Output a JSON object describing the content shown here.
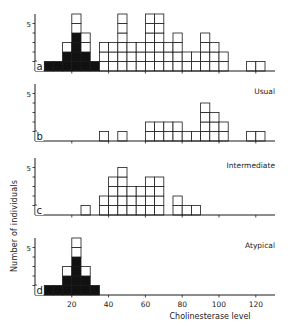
{
  "figure": {
    "ylabel": "Number of individuals",
    "xlabel": "Cholinesterase level"
  },
  "chart_data": [
    {
      "type": "bar",
      "panel": "a",
      "title": "",
      "xlabel": "Cholinesterase level",
      "ylabel": "Number of individuals",
      "bin_width": 5,
      "bin_starts": [
        5,
        10,
        15,
        20,
        25,
        30,
        35,
        40,
        45,
        50,
        55,
        60,
        65,
        70,
        75,
        80,
        85,
        90,
        95,
        100,
        105,
        110,
        115,
        120
      ],
      "series": [
        {
          "name": "Atypical (filled)",
          "color": "#000000",
          "values": [
            1,
            1,
            2,
            4,
            2,
            1,
            0,
            0,
            0,
            0,
            0,
            0,
            0,
            0,
            0,
            0,
            0,
            0,
            0,
            0,
            0,
            0,
            0,
            0
          ]
        },
        {
          "name": "Other (open)",
          "color": "#ffffff",
          "values": [
            0,
            0,
            1,
            2,
            2,
            0,
            3,
            3,
            6,
            3,
            3,
            6,
            6,
            3,
            4,
            2,
            2,
            4,
            3,
            2,
            0,
            0,
            1,
            1
          ]
        }
      ],
      "yticks": [
        5
      ],
      "xlim": [
        0,
        130
      ],
      "ylim": [
        0,
        6.5
      ]
    },
    {
      "type": "bar",
      "panel": "b",
      "title": "Usual",
      "bin_width": 5,
      "bin_starts": [
        5,
        10,
        15,
        20,
        25,
        30,
        35,
        40,
        45,
        50,
        55,
        60,
        65,
        70,
        75,
        80,
        85,
        90,
        95,
        100,
        105,
        110,
        115,
        120
      ],
      "series": [
        {
          "name": "Usual",
          "color": "#ffffff",
          "values": [
            0,
            0,
            0,
            0,
            0,
            0,
            1,
            0,
            1,
            0,
            0,
            2,
            2,
            2,
            2,
            1,
            1,
            4,
            3,
            2,
            0,
            0,
            1,
            1
          ]
        }
      ],
      "yticks": [
        5
      ],
      "xlim": [
        0,
        130
      ],
      "ylim": [
        0,
        6.5
      ]
    },
    {
      "type": "bar",
      "panel": "c",
      "title": "Intermediate",
      "bin_width": 5,
      "bin_starts": [
        5,
        10,
        15,
        20,
        25,
        30,
        35,
        40,
        45,
        50,
        55,
        60,
        65,
        70,
        75,
        80,
        85,
        90,
        95,
        100,
        105,
        110,
        115,
        120
      ],
      "series": [
        {
          "name": "Intermediate",
          "color": "#ffffff",
          "values": [
            0,
            0,
            0,
            0,
            1,
            0,
            2,
            4,
            5,
            3,
            3,
            4,
            4,
            0,
            2,
            1,
            1,
            0,
            0,
            0,
            0,
            0,
            0,
            0
          ]
        }
      ],
      "yticks": [
        5
      ],
      "xlim": [
        0,
        130
      ],
      "ylim": [
        0,
        6.5
      ]
    },
    {
      "type": "bar",
      "panel": "d",
      "title": "Atypical",
      "bin_width": 5,
      "bin_starts": [
        5,
        10,
        15,
        20,
        25,
        30,
        35,
        40,
        45,
        50,
        55,
        60,
        65,
        70,
        75,
        80,
        85,
        90,
        95,
        100,
        105,
        110,
        115,
        120
      ],
      "series": [
        {
          "name": "Atypical (filled)",
          "color": "#000000",
          "values": [
            1,
            1,
            2,
            4,
            2,
            1,
            0,
            0,
            0,
            0,
            0,
            0,
            0,
            0,
            0,
            0,
            0,
            0,
            0,
            0,
            0,
            0,
            0,
            0
          ]
        },
        {
          "name": "Atypical (open)",
          "color": "#ffffff",
          "values": [
            0,
            0,
            1,
            2,
            1,
            0,
            0,
            0,
            0,
            0,
            0,
            0,
            0,
            0,
            0,
            0,
            0,
            0,
            0,
            0,
            0,
            0,
            0,
            0
          ]
        }
      ],
      "xticks": [
        20,
        40,
        60,
        80,
        100,
        120
      ],
      "xtick_labels": [
        "20",
        "40",
        "60",
        "80",
        "100",
        "120"
      ],
      "yticks": [
        5
      ],
      "xlim": [
        0,
        130
      ],
      "ylim": [
        0,
        6.5
      ]
    }
  ],
  "panels": [
    {
      "letter": "a",
      "title": "",
      "ytick": "5"
    },
    {
      "letter": "b",
      "title": "Usual",
      "ytick": "5"
    },
    {
      "letter": "c",
      "title": "Intermediate",
      "ytick": "5"
    },
    {
      "letter": "d",
      "title": "Atypical",
      "ytick": "5"
    }
  ],
  "xtick_labels": [
    "20",
    "40",
    "60",
    "80",
    "100",
    "120"
  ]
}
